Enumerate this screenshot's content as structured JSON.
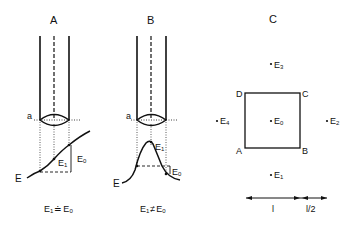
{
  "panels": {
    "A": {
      "title": "A",
      "plane_label": "a",
      "curve_label": "E",
      "point_label_1": "E",
      "point_label_1_sub": "1",
      "point_label_0": "E",
      "point_label_0_sub": "0",
      "equation_left": "E",
      "equation_left_sub": "1",
      "equation_op": "≐",
      "equation_right": "E",
      "equation_right_sub": "0"
    },
    "B": {
      "title": "B",
      "plane_label": "a",
      "curve_label": "E",
      "point_label_1": "E",
      "point_label_1_sub": "1",
      "point_label_0": "E",
      "point_label_0_sub": "0",
      "equation_left": "E",
      "equation_left_sub": "1",
      "equation_op": "≠",
      "equation_right": "E",
      "equation_right_sub": "0"
    },
    "C": {
      "title": "C",
      "corners": {
        "A": "A",
        "B": "B",
        "C": "C",
        "D": "D"
      },
      "points": [
        {
          "name": "E",
          "sub": "0"
        },
        {
          "name": "E",
          "sub": "1"
        },
        {
          "name": "E",
          "sub": "2"
        },
        {
          "name": "E",
          "sub": "3"
        },
        {
          "name": "E",
          "sub": "4"
        }
      ],
      "scale": {
        "full": "l",
        "half": "l/2"
      }
    }
  }
}
